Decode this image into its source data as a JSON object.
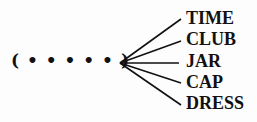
{
  "puzzle": {
    "blank": "( • • • • • )",
    "blank_letters": 5,
    "words": [
      "TIME",
      "CLUB",
      "JAR",
      "CAP",
      "DRESS"
    ]
  }
}
